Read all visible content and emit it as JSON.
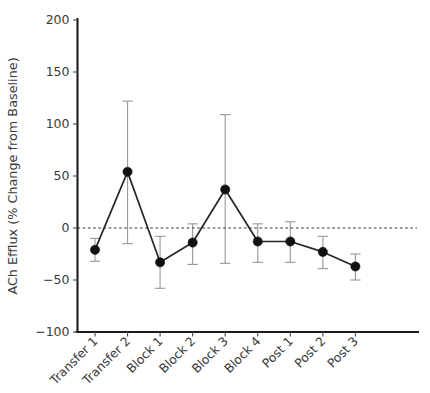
{
  "chart_data": {
    "type": "line",
    "title": "",
    "xlabel": "",
    "ylabel": "ACh Efflux (% Change from Baseline)",
    "categories": [
      "Transfer 1",
      "Transfer 2",
      "Block 1",
      "Block 2",
      "Block 3",
      "Block 4",
      "Post 1",
      "Post 2",
      "Post 3"
    ],
    "values": [
      -21,
      54,
      -33,
      -14,
      37,
      -13,
      -13,
      -23,
      -37
    ],
    "error_upper": [
      -10,
      122,
      -8,
      4,
      109,
      4,
      6,
      -8,
      -25
    ],
    "error_lower": [
      -32,
      -15,
      -58,
      -35,
      -34,
      -33,
      -33,
      -39,
      -50
    ],
    "ylim": [
      -100,
      200
    ],
    "yticks": [
      200,
      150,
      100,
      50,
      0,
      -50,
      -100
    ],
    "ytick_labels": [
      "200",
      "150",
      "100",
      "50",
      "0",
      "−50",
      "−100"
    ],
    "grid": false,
    "legend": null,
    "reference_line": {
      "y": 0,
      "style": "dashed"
    },
    "marker": "filled-circle",
    "xtick_rotation": 45,
    "colors": {
      "line": "#262626",
      "marker": "#111111",
      "error_bar": "#9b9b9b",
      "axis": "#1a1a1a",
      "text": "#3a3a3a",
      "background": "#ffffff"
    }
  }
}
